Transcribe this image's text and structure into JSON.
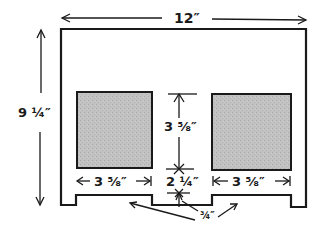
{
  "diagram": {
    "type": "dimensioned cut pattern",
    "colors": {
      "line": "#1a1a1a",
      "panel_fill": "#bdbdbd",
      "background": "#ffffff"
    },
    "labels": {
      "overall_width": "12″",
      "overall_height": "9 ¼″",
      "panel_height": "3 ⅝″",
      "left_panel_width": "3 ⅝″",
      "gap_width": "2 ¼″",
      "right_panel_width": "3 ⅝″",
      "notch_depth": "¾″"
    },
    "dimensions": [
      {
        "name": "overall width",
        "value": "12″"
      },
      {
        "name": "overall height",
        "value": "9 ¼″"
      },
      {
        "name": "window height",
        "value": "3 ⅝″"
      },
      {
        "name": "left window width",
        "value": "3 ⅝″"
      },
      {
        "name": "center gap",
        "value": "2 ¼″"
      },
      {
        "name": "right window width",
        "value": "3 ⅝″"
      },
      {
        "name": "notch depth",
        "value": "¾″"
      }
    ]
  }
}
